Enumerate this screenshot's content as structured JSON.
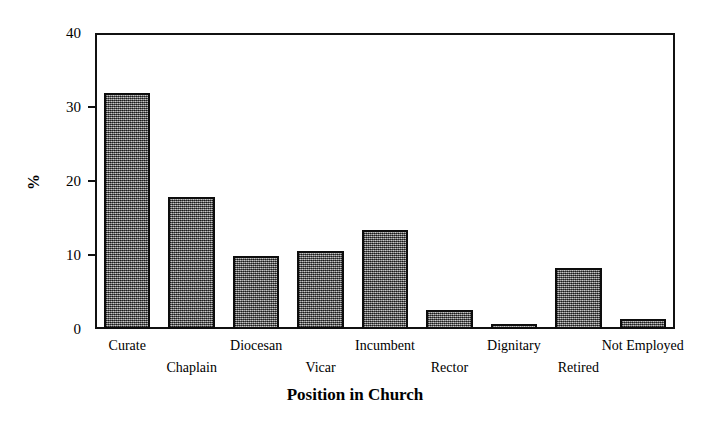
{
  "chart_data": {
    "type": "bar",
    "title": "",
    "xlabel": "Position in Church",
    "ylabel": "%",
    "categories": [
      "Curate",
      "Chaplain",
      "Diocesan",
      "Vicar",
      "Incumbent",
      "Rector",
      "Dignitary",
      "Retired",
      "Not Employed"
    ],
    "values": [
      31.9,
      17.9,
      9.9,
      10.6,
      13.4,
      2.6,
      0.7,
      8.3,
      1.4
    ],
    "ylim": [
      0,
      40
    ],
    "y_ticks": [
      0,
      10,
      20,
      30,
      40
    ],
    "y_tick_labels": [
      "0",
      "10",
      "20",
      "30",
      "40"
    ],
    "grid": false,
    "legend": "none",
    "bar_fill_color": "#8c8c8c",
    "bar_edge_color": "#0d0d0d",
    "frame_color": "#111111",
    "background_color": "#ffffff"
  }
}
